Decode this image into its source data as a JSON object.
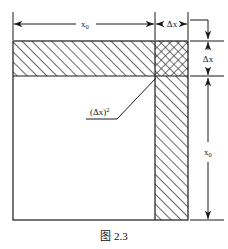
{
  "figure": {
    "caption": "图 2.3",
    "labels": {
      "top_width": "x",
      "top_width_sub": "0",
      "top_delta": "Δx",
      "right_delta": "Δx",
      "right_height": "x",
      "right_height_sub": "0",
      "corner_area_open": "(",
      "corner_area_delta": "Δx",
      "corner_area_close": ")",
      "corner_area_sup": "2"
    },
    "colors": {
      "stroke": "#1a1a1a",
      "hatch": "#2a2a2a",
      "background": "#ffffff",
      "caption": "#111111"
    },
    "geometry": {
      "square_left": 13,
      "square_top": 41,
      "square_right": 188,
      "square_bottom": 220,
      "inner_right": 155,
      "inner_bottom": 76
    },
    "regions": [
      {
        "name": "top-band",
        "hatch": "diagonal",
        "x0": 13,
        "y0": 41,
        "x1": 155,
        "y1": 76
      },
      {
        "name": "corner-square",
        "hatch": "cross",
        "x0": 155,
        "y0": 41,
        "x1": 188,
        "y1": 76
      },
      {
        "name": "right-band",
        "hatch": "diagonal",
        "x0": 155,
        "y0": 76,
        "x1": 188,
        "y1": 220
      },
      {
        "name": "core-square",
        "hatch": "none",
        "x0": 13,
        "y0": 76,
        "x1": 155,
        "y1": 220
      }
    ]
  }
}
